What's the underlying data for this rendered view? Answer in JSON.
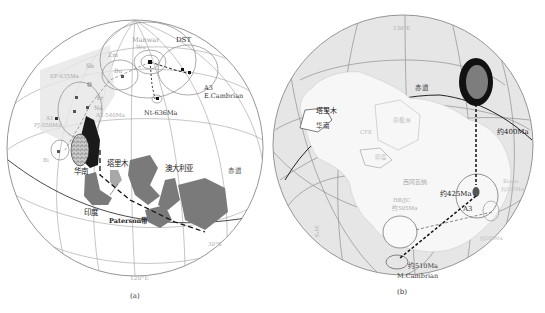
{
  "panel_a": {
    "caption": "(a)",
    "labels": {
      "manwar": "Manwar",
      "dst": "DST",
      "wu": "Wu",
      "zm": "Zm",
      "sb": "Sb",
      "bu": "Bu",
      "ef": "EF-635Ma",
      "tr": "Tr",
      "na": "Na",
      "a2": "A2-540Ma",
      "a1": "A1",
      "pj": "PJ-550Ma",
      "bi": "Bi",
      "nt": "Nt-636Ma",
      "a3": "A3",
      "a3_age": "E.Cambrian",
      "south_china": "华南",
      "tarim": "塔里木",
      "australia": "澳大利亚",
      "india": "印度",
      "paterson": "Paterson带",
      "equator": "赤道",
      "lat": "30°S",
      "lon": "120°E"
    },
    "colors": {
      "continent": "#7a7a7a",
      "dark_block": "#1a1a1a",
      "grid": "#9a9a9a",
      "light_shade": "#e3e3e3"
    }
  },
  "panel_b": {
    "caption": "(b)",
    "labels": {
      "lon": "130°E",
      "equator": "赤道",
      "tarim": "塔里木",
      "south_china": "华南",
      "east_antarctica_wall": "澳大利亚",
      "qfk": "CFK",
      "north_china": "南极洲",
      "india": "印度",
      "west_gondwana": "西冈瓦纳",
      "p400": "约400Ma",
      "p425": "约425Ma",
      "a3": "A3",
      "hr": "HR/JC",
      "hr_age": "约505Ma",
      "p510": "约510Ma",
      "p510_age": "M.Cambrian",
      "side_label": "30°S",
      "right_label1": "Bowie",
      "right_label2": "约505Ma",
      "lower_right": "约505Ma"
    },
    "colors": {
      "globe_fill": "#e6e6e6",
      "landmass": "#f7f7f7",
      "pole_ring": "#111111",
      "pole_core": "#7d7d7d",
      "grid": "#8f8f8f"
    }
  }
}
